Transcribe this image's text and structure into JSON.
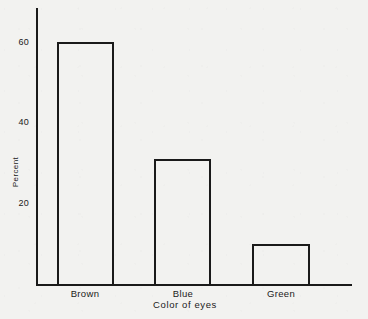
{
  "chart_data": {
    "type": "bar",
    "title": "",
    "subtitle": "",
    "categories": [
      "Brown",
      "Blue",
      "Green"
    ],
    "values": [
      60,
      30,
      10
    ],
    "series": [
      {
        "name": "Percent",
        "values": [
          60,
          30,
          10
        ]
      }
    ],
    "xlabel": "Color of eyes",
    "ylabel": "Percent",
    "ylim": [
      0,
      69
    ],
    "yticks": [
      20,
      40,
      60
    ],
    "ytick_labels": [
      "20",
      "40",
      "60"
    ],
    "xtick_labels": [
      "Brown",
      "Blue",
      "Green"
    ],
    "grid": false,
    "legend": false,
    "legend_position": "none",
    "annotations": [],
    "bar_style": {
      "fill": "none",
      "edge_color": "#1a1a1a",
      "edge_width": 2
    },
    "axis_color": "#1a1a1a",
    "background_color": "#f2f2f0"
  },
  "geometry": {
    "plot_left": 36,
    "plot_baseline": 284,
    "plot_top": 8,
    "plot_right": 352,
    "bars": [
      {
        "label": "Brown",
        "left": 57,
        "width": 57,
        "top": 42,
        "center": 85
      },
      {
        "label": "Blue",
        "left": 154,
        "width": 57,
        "top": 159,
        "center": 183
      },
      {
        "label": "Green",
        "left": 252,
        "width": 58,
        "top": 244,
        "center": 281
      }
    ],
    "yticks": [
      {
        "label": "20",
        "top": 198
      },
      {
        "label": "40",
        "top": 117
      },
      {
        "label": "60",
        "top": 37
      }
    ],
    "xtick_label_top": 288
  }
}
